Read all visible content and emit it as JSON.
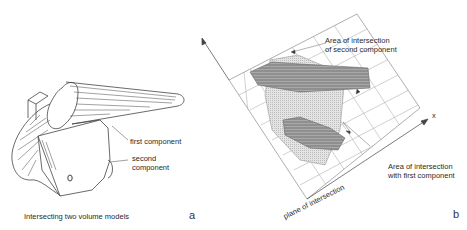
{
  "panel_a": {
    "caption": "Intersecting two volume models",
    "tag": "a",
    "labels": {
      "first_component": "first component",
      "second_component_line1": "second",
      "second_component_line2": "component"
    }
  },
  "panel_b": {
    "tag": "b",
    "axis_x": "x",
    "plane_label": "plane of intersection",
    "labels": {
      "second_area_line1": "Area of intersection",
      "second_area_line2": "of second component",
      "first_area_line1": "Area of intersection",
      "first_area_line2": "with first component"
    }
  },
  "colors": {
    "line": "#555555",
    "grid": "#9a9a9a",
    "shade_dark": "#8c8c8c",
    "shade_light": "#d8d8d8"
  }
}
